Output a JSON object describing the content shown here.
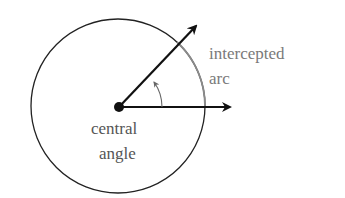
{
  "diagram": {
    "labels": {
      "arc_line1": "intercepted",
      "arc_line2": "arc",
      "angle_line1": "central",
      "angle_line2": "angle"
    },
    "colors": {
      "circle": "#222222",
      "intercepted_arc": "#8a8a8a",
      "rays": "#111111",
      "angle_marker": "#666666",
      "label_text": "#7a7a7a"
    }
  }
}
